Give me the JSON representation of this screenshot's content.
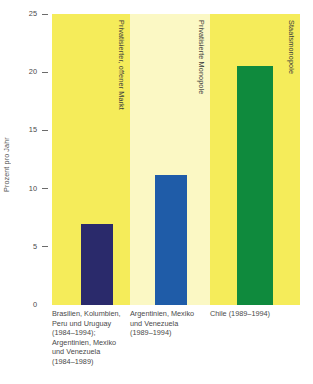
{
  "chart_data": {
    "type": "bar",
    "title": "",
    "subtitle": "",
    "xlabel": "",
    "ylabel": "Prozent pro Jahr",
    "ylim": [
      0,
      25
    ],
    "grid": false,
    "legend_position": "none",
    "y_ticks": [
      "25",
      "20",
      "15",
      "10",
      "5",
      "0"
    ],
    "y_tick_values": [
      25,
      20,
      15,
      10,
      5,
      0
    ],
    "categories": [
      "Brasilien, Kolumbien,\nPeru und Uruguay\n(1984–1994);\nArgentinien, Mexiko\nund Venezuela\n(1984–1989)",
      "Argentinien, Mexiko\nund Venezuela\n(1989–1994)",
      "Chile (1989–1994)"
    ],
    "values": [
      7.0,
      11.2,
      20.5
    ],
    "group_annotations": [
      "Privatisierter, offener Markt",
      "Privatisierte Monopole",
      "Staatsmonopole"
    ],
    "bar_colors": [
      "#2a2a6b",
      "#1f5ca8",
      "#0f8a3d"
    ],
    "panel_colors": [
      "#f5ec5a",
      "#fbf8c4",
      "#f5ec5a"
    ]
  },
  "axis": {
    "y_title": "Prozent pro Jahr",
    "ticks": [
      {
        "label": "25",
        "value": 25
      },
      {
        "label": "20",
        "value": 20
      },
      {
        "label": "15",
        "value": 15
      },
      {
        "label": "10",
        "value": 10
      },
      {
        "label": "5",
        "value": 5
      },
      {
        "label": "0",
        "value": 0
      }
    ]
  },
  "panels": [
    {
      "annotation": "Privatisierter, offener Markt",
      "category": "Brasilien, Kolumbien,\nPeru und Uruguay\n(1984–1994);\nArgentinien, Mexiko\nund Venezuela\n(1984–1989)",
      "value": 7.0,
      "bar_color": "#2a2a6b",
      "panel_color": "#f5ec5a"
    },
    {
      "annotation": "Privatisierte Monopole",
      "category": "Argentinien, Mexiko\nund Venezuela\n(1989–1994)",
      "value": 11.2,
      "bar_color": "#1f5ca8",
      "panel_color": "#fbf8c4"
    },
    {
      "annotation": "Staatsmonopole",
      "category": "Chile (1989–1994)",
      "value": 20.5,
      "bar_color": "#0f8a3d",
      "panel_color": "#f5ec5a"
    }
  ]
}
